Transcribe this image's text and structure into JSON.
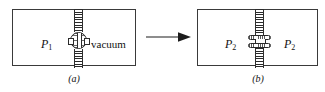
{
  "figure": {
    "panels": [
      {
        "id": "a",
        "caption": "(a)",
        "left_chamber_label": "P",
        "left_chamber_subscript": "1",
        "right_chamber_label": "vacuum",
        "valve_state": "closed",
        "partition_style": "hatched"
      },
      {
        "id": "b",
        "caption": "(b)",
        "left_chamber_label": "P",
        "left_chamber_subscript": "2",
        "right_chamber_label": "P",
        "right_chamber_subscript": "2",
        "valve_state": "open",
        "partition_style": "hatched"
      }
    ],
    "arrow": {
      "direction": "right",
      "name": "process-arrow"
    },
    "colors": {
      "ink": "#111111",
      "line": "#2b2b2b",
      "border": "#3a3a3a",
      "background": "#ffffff",
      "hatch": "#2e2e2e"
    }
  }
}
